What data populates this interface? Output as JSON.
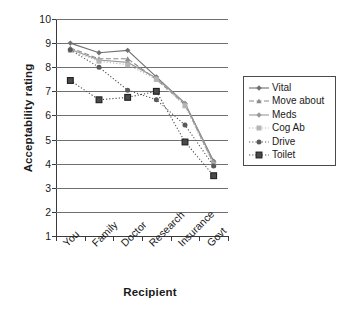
{
  "chart_data": {
    "type": "line",
    "title": "",
    "xlabel": "Recipient",
    "ylabel": "Acceptability rating",
    "categories": [
      "You",
      "Family",
      "Doctor",
      "Research",
      "Insurance",
      "Govt"
    ],
    "ylim": [
      1,
      10
    ],
    "yticks": [
      1,
      2,
      3,
      4,
      5,
      6,
      7,
      8,
      9,
      10
    ],
    "grid": true,
    "legend_position": "right",
    "series": [
      {
        "name": "Vital",
        "values": [
          9.0,
          8.6,
          8.7,
          7.6,
          6.5,
          4.1
        ],
        "color": "#707070",
        "line": "solid",
        "marker": "diamond"
      },
      {
        "name": "Move about",
        "values": [
          8.8,
          8.35,
          8.35,
          7.5,
          6.45,
          4.0
        ],
        "color": "#8a8a8a",
        "line": "dashed",
        "marker": "triangle"
      },
      {
        "name": "Meds",
        "values": [
          8.75,
          8.3,
          8.2,
          7.55,
          6.5,
          4.05
        ],
        "color": "#9a9a9a",
        "line": "solid",
        "marker": "diamond"
      },
      {
        "name": "Cog Ab",
        "values": [
          8.7,
          8.25,
          8.1,
          7.5,
          6.4,
          3.95
        ],
        "color": "#b5b5b5",
        "line": "dotted",
        "marker": "square"
      },
      {
        "name": "Drive",
        "values": [
          8.72,
          8.0,
          7.05,
          6.65,
          5.6,
          3.9
        ],
        "color": "#5a5a5a",
        "line": "dotted",
        "marker": "circle"
      },
      {
        "name": "Toilet",
        "values": [
          7.45,
          6.65,
          6.75,
          7.0,
          4.9,
          3.5
        ],
        "color": "#4a4a4a",
        "line": "dotted",
        "marker": "squarefill"
      }
    ]
  },
  "axis": {
    "y_title": "Acceptability rating",
    "x_title": "Recipient",
    "y_tick_labels": [
      "10",
      "9",
      "8",
      "7",
      "6",
      "5",
      "4",
      "3",
      "2",
      "1"
    ],
    "x_tick_labels": [
      "You",
      "Family",
      "Doctor",
      "Research",
      "Insurance",
      "Govt"
    ]
  },
  "legend": {
    "items": [
      {
        "label": "Vital"
      },
      {
        "label": "Move about"
      },
      {
        "label": "Meds"
      },
      {
        "label": "Cog Ab"
      },
      {
        "label": "Drive"
      },
      {
        "label": "Toilet"
      }
    ]
  }
}
